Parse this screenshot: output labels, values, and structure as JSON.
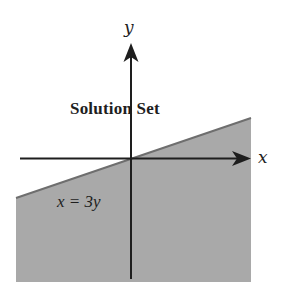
{
  "diagram": {
    "title": "Solution Set",
    "boundary_label": "x = 3y",
    "axes": {
      "x_label": "x",
      "y_label": "y"
    },
    "colors": {
      "shaded_region": "#a9a9a9",
      "boundary_line": "#6e6e6e",
      "axis": "#1e1e1e",
      "background": "#ffffff"
    }
  }
}
